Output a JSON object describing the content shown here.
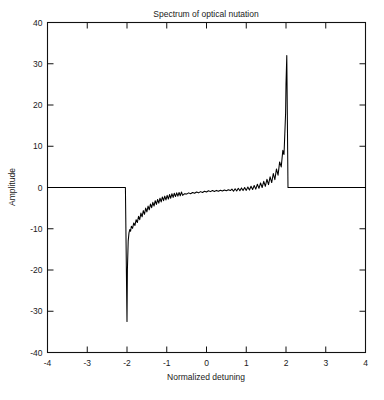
{
  "chart_data": {
    "type": "line",
    "title": "Spectrum of optical nutation",
    "xlabel": "Normalized detuning",
    "ylabel": "Amplitude",
    "xlim": [
      -4,
      4
    ],
    "ylim": [
      -40,
      40
    ],
    "grid": false,
    "legend": null,
    "xticks": [
      -4,
      -3,
      -2,
      -1,
      0,
      1,
      2,
      3,
      4
    ],
    "xtick_labels": [
      "-4",
      "-3",
      "-2",
      "-1",
      "0",
      "1",
      "2",
      "3",
      "4"
    ],
    "yticks": [
      -40,
      -30,
      -20,
      -10,
      0,
      10,
      20,
      30,
      40
    ],
    "ytick_labels": [
      "-40",
      "-30",
      "-20",
      "-10",
      "0",
      "10",
      "20",
      "30",
      "40"
    ],
    "line_color": "#000000",
    "series": [
      {
        "name": "Spectrum",
        "x": [
          -4.0,
          -3.8,
          -3.6,
          -3.4,
          -3.2,
          -3.0,
          -2.8,
          -2.6,
          -2.4,
          -2.2,
          -2.1,
          -2.04,
          -2.0,
          -1.99,
          -1.97,
          -1.95,
          -1.93,
          -1.91,
          -1.89,
          -1.86,
          -1.83,
          -1.8,
          -1.77,
          -1.74,
          -1.71,
          -1.68,
          -1.65,
          -1.62,
          -1.59,
          -1.56,
          -1.53,
          -1.5,
          -1.47,
          -1.44,
          -1.41,
          -1.38,
          -1.35,
          -1.32,
          -1.29,
          -1.26,
          -1.23,
          -1.2,
          -1.17,
          -1.14,
          -1.11,
          -1.08,
          -1.05,
          -1.02,
          -0.99,
          -0.96,
          -0.93,
          -0.9,
          -0.87,
          -0.84,
          -0.81,
          -0.78,
          -0.75,
          -0.72,
          -0.69,
          -0.66,
          -0.63,
          -0.6,
          -0.55,
          -0.5,
          -0.45,
          -0.4,
          -0.35,
          -0.3,
          -0.25,
          -0.2,
          -0.15,
          -0.1,
          -0.05,
          0.0,
          0.05,
          0.1,
          0.15,
          0.2,
          0.25,
          0.3,
          0.35,
          0.4,
          0.45,
          0.5,
          0.55,
          0.6,
          0.64,
          0.68,
          0.72,
          0.76,
          0.8,
          0.84,
          0.88,
          0.92,
          0.96,
          1.0,
          1.04,
          1.08,
          1.12,
          1.16,
          1.2,
          1.24,
          1.28,
          1.32,
          1.36,
          1.4,
          1.44,
          1.48,
          1.52,
          1.56,
          1.6,
          1.64,
          1.68,
          1.72,
          1.76,
          1.8,
          1.84,
          1.88,
          1.92,
          1.95,
          1.97,
          1.99,
          2.0,
          2.02,
          2.05,
          2.1,
          2.2,
          2.4,
          2.6,
          2.8,
          3.0,
          3.2,
          3.4,
          3.6,
          3.8,
          4.0
        ],
        "y": [
          0,
          0,
          0,
          0,
          0,
          0,
          0,
          0,
          0,
          0,
          0,
          0,
          -32.5,
          -20.0,
          -13.0,
          -11.0,
          -10.2,
          -10.6,
          -9.4,
          -9.9,
          -8.6,
          -9.2,
          -7.8,
          -8.5,
          -7.0,
          -7.8,
          -6.2,
          -7.1,
          -5.6,
          -6.5,
          -5.0,
          -5.9,
          -4.5,
          -5.4,
          -4.0,
          -4.9,
          -3.6,
          -4.5,
          -3.2,
          -4.1,
          -2.9,
          -3.8,
          -2.6,
          -3.5,
          -2.3,
          -3.2,
          -2.1,
          -3.0,
          -1.9,
          -2.8,
          -1.7,
          -2.6,
          -1.5,
          -2.4,
          -1.4,
          -2.2,
          -1.3,
          -2.1,
          -1.2,
          -2.0,
          -1.1,
          -1.9,
          -1.5,
          -1.6,
          -1.3,
          -1.5,
          -1.2,
          -1.4,
          -1.1,
          -1.3,
          -1.0,
          -1.2,
          -0.9,
          -1.1,
          -0.8,
          -1.0,
          -0.75,
          -0.95,
          -0.7,
          -0.9,
          -0.65,
          -0.85,
          -0.6,
          -0.8,
          -0.55,
          -0.75,
          -0.4,
          -0.9,
          -0.3,
          -0.85,
          -0.2,
          -0.8,
          -0.1,
          -0.75,
          0.0,
          -0.7,
          0.1,
          -0.6,
          0.3,
          -0.5,
          0.5,
          -0.4,
          0.8,
          -0.2,
          1.1,
          0.0,
          1.5,
          0.3,
          2.0,
          0.7,
          2.6,
          1.2,
          3.4,
          1.9,
          4.5,
          3.0,
          6.2,
          5.0,
          9.0,
          8.0,
          13.0,
          18.0,
          25.0,
          32.0,
          0,
          0,
          0,
          0,
          0,
          0,
          0,
          0,
          0,
          0,
          0,
          0
        ]
      }
    ]
  }
}
